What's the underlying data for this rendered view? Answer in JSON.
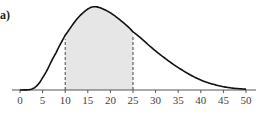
{
  "panel_label": "a)",
  "chart_data": {
    "type": "area",
    "title": "",
    "xlabel": "",
    "ylabel": "",
    "x_ticks": [
      0,
      5,
      10,
      15,
      20,
      25,
      30,
      35,
      40,
      45,
      50
    ],
    "xlim": [
      0,
      50
    ],
    "grid": false,
    "legend": null,
    "shaded_interval": [
      10,
      25
    ],
    "dashed_lines_x": [
      10,
      25
    ],
    "curve": {
      "x": [
        0,
        3,
        5,
        8,
        10,
        13,
        16,
        19,
        22,
        25,
        30,
        35,
        40,
        45,
        50
      ],
      "y_relative": [
        0,
        0.02,
        0.15,
        0.45,
        0.66,
        0.88,
        1.0,
        0.96,
        0.85,
        0.7,
        0.47,
        0.27,
        0.12,
        0.04,
        0.01
      ]
    },
    "colors": {
      "curve": "#111111",
      "shade": "#e6e6e6",
      "axis": "#555555"
    }
  }
}
